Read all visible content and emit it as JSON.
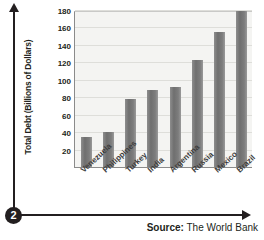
{
  "step_marker": "2",
  "source": {
    "label": "Source:",
    "value": "The World Bank"
  },
  "icons": {
    "y_axis_arrow": "arrow-up-icon",
    "x_axis_arrow": "arrow-right-icon"
  },
  "colors": {
    "bar_fill": "#7d7d7d",
    "plot_background": "#f4f4f2",
    "gridline": "#dededa",
    "axis_line": "#8b8b8b",
    "text": "#231f20",
    "marker_background": "#231f20",
    "marker_text": "#ffffff"
  },
  "chart_data": {
    "type": "bar",
    "title": "",
    "xlabel": "",
    "ylabel": "Total Debt (Billions of Dollars)",
    "categories": [
      "Venezuela",
      "Philippines",
      "Turkey",
      "India",
      "Argentina",
      "Russia",
      "Mexico",
      "Brazil"
    ],
    "values": [
      35,
      41,
      79,
      89,
      93,
      124,
      156,
      180
    ],
    "ylim": [
      0,
      180
    ],
    "yticks": [
      20,
      40,
      60,
      80,
      100,
      120,
      140,
      160,
      180
    ],
    "ytick_labels": [
      "20",
      "40",
      "60",
      "80",
      "100",
      "120",
      "140",
      "160",
      "180"
    ],
    "grid": true,
    "legend": false,
    "legend_position": "none"
  }
}
